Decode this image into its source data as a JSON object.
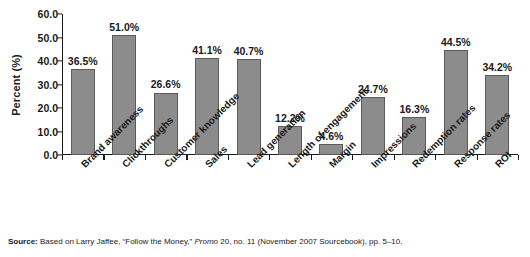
{
  "chart_data": {
    "type": "bar",
    "title": "",
    "xlabel": "",
    "ylabel": "Percent (%)",
    "ylim": [
      0,
      60
    ],
    "ytick_step": 10,
    "grid": false,
    "legend": "none",
    "bar_color": "#8c8c8c",
    "bar_edge_color": "#5a5a5a",
    "value_suffix": "%",
    "categories": [
      "Brand awareness",
      "Clickthroughs",
      "Customer knowledge",
      "Sales",
      "Lead generation",
      "Length of engagement",
      "Margin",
      "Impressions",
      "Redemption rates",
      "Response rates",
      "ROI"
    ],
    "values": [
      36.5,
      51.0,
      26.6,
      41.1,
      40.7,
      12.2,
      4.6,
      24.7,
      16.3,
      44.5,
      34.2
    ],
    "value_labels": [
      "36.5%",
      "51.0%",
      "26.6%",
      "41.1%",
      "40.7%",
      "12.2%",
      "4.6%",
      "24.7%",
      "16.3%",
      "44.5%",
      "34.2%"
    ],
    "ytick_labels": [
      "0.0",
      "10.0",
      "20.0",
      "30.0",
      "40.0",
      "50.0",
      "60.0"
    ],
    "ytick_values": [
      0,
      10,
      20,
      30,
      40,
      50,
      60
    ]
  },
  "source": {
    "label": "Source:",
    "text_before_italic": " Based on Larry Jaffee, “Follow the Money,” ",
    "italic_text": "Promo",
    "text_after_italic": " 20, no. 11 (November 2007 Sourcebook), pp. 5–10."
  }
}
